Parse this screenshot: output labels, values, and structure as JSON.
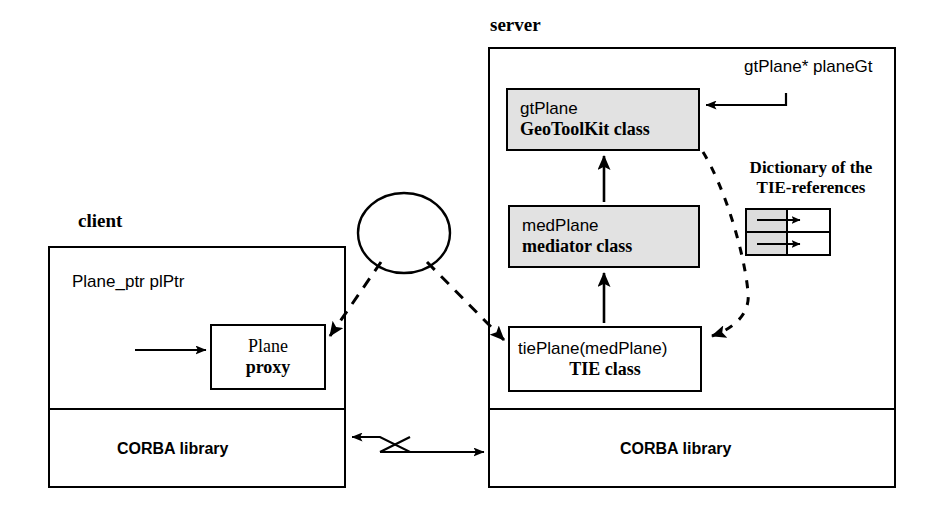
{
  "figure": {
    "type": "architecture-diagram",
    "background": "#ffffff",
    "stroke": "#000000",
    "shaded_fill": "#e2e2e2"
  },
  "client": {
    "title": "client",
    "variable_label": "Plane_ptr plPtr",
    "proxy_box": {
      "line1": "Plane",
      "line2": "proxy"
    },
    "corba_label": "CORBA library"
  },
  "server": {
    "title": "server",
    "pointer_label": "gtPlane* planeGt",
    "gt_box": {
      "line1": "gtPlane",
      "line2": "GeoToolKit class"
    },
    "med_box": {
      "line1": "medPlane",
      "line2": "mediator class"
    },
    "tie_box": {
      "line1": "tiePlane(medPlane)",
      "line2": "TIE class"
    },
    "corba_label": "CORBA library",
    "dictionary": {
      "title_line1": "Dictionary of the",
      "title_line2": "TIE-references",
      "rows": [
        {
          "key": "",
          "value": ""
        },
        {
          "key": "",
          "value": ""
        }
      ]
    }
  },
  "idl": {
    "line1": "IDL",
    "line2": "Spec."
  }
}
